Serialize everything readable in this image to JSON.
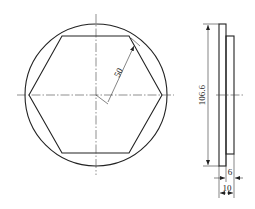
{
  "drawing": {
    "type": "engineering-drawing",
    "front_view": {
      "outer_shape": "circle",
      "inner_shape": "hexagon",
      "dimension_radius_label": "50"
    },
    "side_view": {
      "dimension_height_label": "106.6",
      "dimension_step_label": "6",
      "dimension_thickness_label": "10"
    }
  },
  "colors": {
    "line": "#222222",
    "background": "#ffffff"
  }
}
